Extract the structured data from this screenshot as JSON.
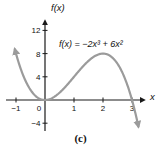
{
  "figure": {
    "caption": "(c)"
  },
  "chart_data": {
    "type": "line",
    "title": "",
    "equation_label": "f(x) = −2x³ + 6x²",
    "xlabel": "x",
    "ylabel": "f(x)",
    "x_ticks": [
      -1,
      0,
      1,
      2,
      3
    ],
    "y_ticks": [
      -4,
      4,
      8,
      12
    ],
    "xlim": [
      -1.4,
      3.6
    ],
    "ylim": [
      -6,
      14
    ],
    "grid": false,
    "legend_position": "none",
    "function": {
      "expression": "-2x^3 + 6x^2",
      "coefficients": {
        "x3": -2,
        "x2": 6,
        "x1": 0,
        "x0": 0
      },
      "draw_domain": [
        -1.04,
        3.22
      ],
      "arrows_at_ends": true
    },
    "key_points": [
      {
        "x": -1,
        "y": 8
      },
      {
        "x": 0,
        "y": 0
      },
      {
        "x": 1,
        "y": 4
      },
      {
        "x": 2,
        "y": 8
      },
      {
        "x": 3,
        "y": 0
      }
    ],
    "colors": {
      "curve": "#9b9b9b",
      "axis": "#1a1a1a",
      "text": "#111111",
      "background": "#ffffff"
    }
  }
}
